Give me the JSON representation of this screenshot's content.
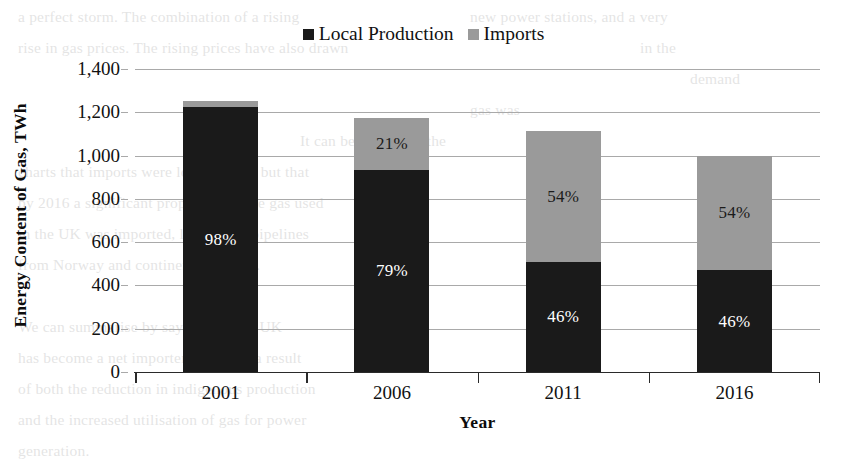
{
  "chart_data": {
    "type": "bar",
    "stacked": true,
    "title": "",
    "xlabel": "Year",
    "ylabel": "Energy Content of Gas, TWh",
    "categories": [
      "2001",
      "2006",
      "2011",
      "2016"
    ],
    "ylim": [
      0,
      1400
    ],
    "ytick_values": [
      0,
      200,
      400,
      600,
      800,
      1000,
      1200,
      1400
    ],
    "ytick_labels": [
      "0",
      "200",
      "400",
      "600",
      "800",
      "1,000",
      "1,200",
      "1,400"
    ],
    "grid": true,
    "legend_position": "top-center",
    "series": [
      {
        "name": "Local Production",
        "color": "#1a1a1a",
        "values": [
          1225,
          935,
          510,
          470
        ],
        "labels": [
          "98%",
          "79%",
          "46%",
          "46%"
        ]
      },
      {
        "name": "Imports",
        "color": "#9a9a9a",
        "values": [
          25,
          240,
          605,
          530
        ],
        "labels": [
          "",
          "21%",
          "54%",
          "54%"
        ]
      }
    ],
    "totals": [
      1250,
      1175,
      1115,
      1000
    ]
  },
  "legend": {
    "items": [
      {
        "label": "Local Production",
        "marker": "square-dark",
        "color": "#1a1a1a"
      },
      {
        "label": "Imports",
        "marker": "square-gray",
        "color": "#9a9a9a"
      }
    ]
  },
  "page_background_text": {
    "lines": [
      {
        "text": "a perfect storm. The combination of a rising",
        "x": 18,
        "y": 2
      },
      {
        "text": "new power stations, and a very",
        "x": 470,
        "y": 2
      },
      {
        "text": "rise in gas prices. The rising prices have also drawn",
        "x": 18,
        "y": 33
      },
      {
        "text": "in the",
        "x": 640,
        "y": 33
      },
      {
        "text": "demand",
        "x": 690,
        "y": 64
      },
      {
        "text": "gas was",
        "x": 470,
        "y": 95
      },
      {
        "text": "It can be seen from the",
        "x": 300,
        "y": 126
      },
      {
        "text": "charts that imports were low in 2001, but that",
        "x": 18,
        "y": 157
      },
      {
        "text": "by 2016 a significant proportion of the gas used",
        "x": 18,
        "y": 188
      },
      {
        "text": "in the UK was imported, largely via pipelines",
        "x": 18,
        "y": 219
      },
      {
        "text": "from Norway and continental Europe.",
        "x": 18,
        "y": 250
      },
      {
        "text": "We can summarise by saying that the UK",
        "x": 18,
        "y": 312
      },
      {
        "text": "has become a net importer of gas, as a result",
        "x": 18,
        "y": 343
      },
      {
        "text": "of both the reduction in indigenous production",
        "x": 18,
        "y": 374
      },
      {
        "text": "and the increased utilisation of gas for power",
        "x": 18,
        "y": 405
      },
      {
        "text": "generation.",
        "x": 18,
        "y": 436
      }
    ]
  }
}
